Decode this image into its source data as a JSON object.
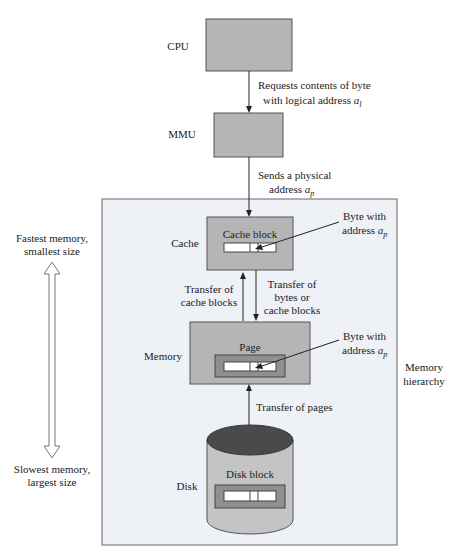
{
  "diagram": {
    "colors": {
      "box_fill": "#b5b5b5",
      "box_stroke": "#555555",
      "inner_fill": "#8f8f8f",
      "slot_fill": "#ffffff",
      "hierarchy_fill": "#eef1f5",
      "hierarchy_stroke": "#666666",
      "disk_top": "#4a4a4a",
      "disk_body": "#c4c4c4",
      "line": "#222222"
    },
    "nodes": {
      "cpu": {
        "label": "CPU"
      },
      "mmu": {
        "label": "MMU"
      },
      "cache": {
        "label": "Cache",
        "inner_label": "Cache block"
      },
      "memory": {
        "label": "Memory",
        "inner_label": "Page"
      },
      "disk": {
        "label": "Disk",
        "inner_label": "Disk block"
      }
    },
    "edges": {
      "cpu_to_mmu": {
        "line1": "Requests contents of byte",
        "line2": "with logical address ",
        "var": "a",
        "sub": "l"
      },
      "mmu_to_cache": {
        "line1": "Sends a physical",
        "line2": "address ",
        "var": "a",
        "sub": "p"
      },
      "memory_to_cache": {
        "line1": "Transfer of",
        "line2": "cache blocks"
      },
      "cache_to_memory": {
        "line1": "Transfer of",
        "line2": "bytes or",
        "line3": "cache blocks"
      },
      "disk_memory": {
        "label": "Transfer of pages"
      }
    },
    "callouts": {
      "cache_byte": {
        "line1": "Byte with",
        "line2": "address ",
        "var": "a",
        "sub": "p"
      },
      "memory_byte": {
        "line1": "Byte with",
        "line2": "address ",
        "var": "a",
        "sub": "p"
      }
    },
    "hierarchy": {
      "line1": "Memory",
      "line2": "hierarchy"
    },
    "scale": {
      "top_line1": "Fastest memory,",
      "top_line2": "smallest size",
      "bottom_line1": "Slowest memory,",
      "bottom_line2": "largest size"
    }
  }
}
